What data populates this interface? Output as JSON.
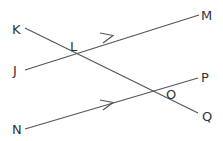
{
  "diagram": {
    "type": "geometry-parallel-lines-transversal",
    "line_color": "#555555",
    "label_color": "#333333",
    "points": {
      "K": {
        "label": "K"
      },
      "J": {
        "label": "J"
      },
      "L": {
        "label": "L"
      },
      "M": {
        "label": "M"
      },
      "N": {
        "label": "N"
      },
      "O": {
        "label": "O"
      },
      "P": {
        "label": "P"
      },
      "Q": {
        "label": "Q"
      }
    },
    "lines": [
      {
        "id": "JM",
        "from": "J",
        "to": "M",
        "arrow": true,
        "description": "parallel line with arrow"
      },
      {
        "id": "NP",
        "from": "N",
        "to": "P",
        "arrow": true,
        "description": "parallel line with arrow"
      },
      {
        "id": "KQ",
        "from": "K",
        "to": "Q",
        "arrow": false,
        "description": "transversal"
      }
    ],
    "intersections": [
      {
        "point": "L",
        "lines": [
          "JM",
          "KQ"
        ]
      },
      {
        "point": "O",
        "lines": [
          "NP",
          "KQ"
        ]
      }
    ]
  }
}
